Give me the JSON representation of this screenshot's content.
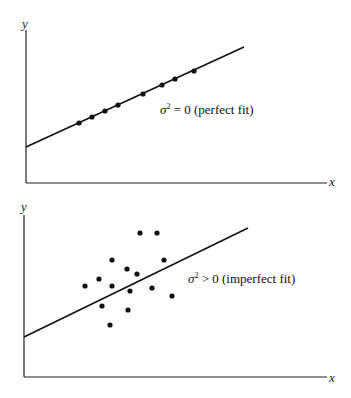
{
  "panels": [
    {
      "axis_y_label": "y",
      "axis_x_label": "x",
      "sigma": "σ",
      "sup": "2",
      "relation": " = 0 (perfect fit)"
    },
    {
      "axis_y_label": "y",
      "axis_x_label": "x",
      "sigma": "σ",
      "sup": "2",
      "relation": " > 0 (imperfect fit)"
    }
  ],
  "chart_data": [
    {
      "type": "scatter",
      "title": "σ² = 0 (perfect fit)",
      "xlabel": "x",
      "ylabel": "y",
      "grid": false,
      "fit_line": {
        "x1": 26,
        "y1": 147,
        "x2": 244,
        "y2": 47
      },
      "points": [
        [
          79,
          123
        ],
        [
          92,
          117
        ],
        [
          105,
          111
        ],
        [
          118,
          105
        ],
        [
          143,
          94
        ],
        [
          162,
          85
        ],
        [
          175,
          79
        ],
        [
          194,
          71
        ]
      ]
    },
    {
      "type": "scatter",
      "title": "σ² > 0 (imperfect fit)",
      "xlabel": "x",
      "ylabel": "y",
      "grid": false,
      "fit_line": {
        "x1": 24,
        "y1": 337,
        "x2": 248,
        "y2": 228
      },
      "points": [
        [
          140,
          233
        ],
        [
          157,
          233
        ],
        [
          112,
          260
        ],
        [
          164,
          260
        ],
        [
          127,
          269
        ],
        [
          137,
          274
        ],
        [
          85,
          286
        ],
        [
          99,
          279
        ],
        [
          112,
          286
        ],
        [
          130,
          291
        ],
        [
          152,
          288
        ],
        [
          172,
          296
        ],
        [
          102,
          306
        ],
        [
          128,
          310
        ],
        [
          110,
          325
        ]
      ]
    }
  ]
}
